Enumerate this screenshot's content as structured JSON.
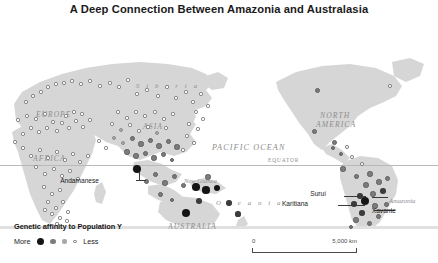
{
  "title": "A Deep Connection Between Amazonia and Australasia",
  "map": {
    "equator_label": "EQUATOR",
    "geo_labels": [
      {
        "text": "EUROPE",
        "x": 36,
        "y": 86,
        "size": 7.4,
        "style": "caps"
      },
      {
        "text": "AFRICA",
        "x": 33,
        "y": 130,
        "size": 7.6,
        "style": "caps"
      },
      {
        "text": "ASIA",
        "x": 143,
        "y": 98,
        "size": 7.6,
        "style": "caps"
      },
      {
        "text": "S i b e r i a",
        "x": 136,
        "y": 58,
        "size": 6.8,
        "style": "spaced"
      },
      {
        "text": "PACIFIC OCEAN",
        "x": 212,
        "y": 119,
        "size": 8.2,
        "style": "caps"
      },
      {
        "text": "NORTH",
        "x": 320,
        "y": 87,
        "size": 7.6,
        "style": "caps"
      },
      {
        "text": "AMERICA",
        "x": 316,
        "y": 96,
        "size": 7.6,
        "style": "caps"
      },
      {
        "text": "SOUTH",
        "x": 352,
        "y": 208,
        "size": 7.6,
        "style": "caps"
      },
      {
        "text": "AMERICA",
        "x": 347,
        "y": 217,
        "size": 7.6,
        "style": "caps"
      },
      {
        "text": "AUSTRALIA",
        "x": 168,
        "y": 198,
        "size": 7.6,
        "style": "caps"
      },
      {
        "text": "New Guinea",
        "x": 184,
        "y": 153,
        "size": 6.6,
        "style": "plain"
      },
      {
        "text": "O c e a n i a",
        "x": 216,
        "y": 175,
        "size": 6.8,
        "style": "spaced"
      },
      {
        "text": "Amazonia",
        "x": 389,
        "y": 173,
        "size": 6.6,
        "style": "plain"
      }
    ],
    "annotations": [
      {
        "text": "Andamanese",
        "x": 99,
        "y": 156
      },
      {
        "text": "Suruí",
        "x": 326,
        "y": 169
      },
      {
        "text": "Karitiana",
        "x": 308,
        "y": 179
      },
      {
        "text": "Xavante",
        "x": 396,
        "y": 186
      }
    ],
    "dots": [
      {
        "x": 26,
        "y": 78,
        "c": "open",
        "s": 3.4
      },
      {
        "x": 33,
        "y": 72,
        "c": "open",
        "s": 3.4
      },
      {
        "x": 41,
        "y": 68,
        "c": "open",
        "s": 3.2
      },
      {
        "x": 48,
        "y": 63,
        "c": "open",
        "s": 3.2
      },
      {
        "x": 56,
        "y": 60,
        "c": "open",
        "s": 3.2
      },
      {
        "x": 64,
        "y": 59,
        "c": "open",
        "s": 3.4
      },
      {
        "x": 72,
        "y": 57,
        "c": "open",
        "s": 3.2
      },
      {
        "x": 81,
        "y": 60,
        "c": "open",
        "s": 3.2
      },
      {
        "x": 90,
        "y": 57,
        "c": "open",
        "s": 3.2
      },
      {
        "x": 100,
        "y": 62,
        "c": "open",
        "s": 3.2
      },
      {
        "x": 110,
        "y": 59,
        "c": "open",
        "s": 3.2
      },
      {
        "x": 119,
        "y": 63,
        "c": "open",
        "s": 3.2
      },
      {
        "x": 128,
        "y": 56,
        "c": "open",
        "s": 3.2
      },
      {
        "x": 137,
        "y": 70,
        "c": "open",
        "s": 3.2
      },
      {
        "x": 147,
        "y": 66,
        "c": "open",
        "s": 3.2
      },
      {
        "x": 158,
        "y": 72,
        "c": "open",
        "s": 3.2
      },
      {
        "x": 167,
        "y": 63,
        "c": "open",
        "s": 3.2
      },
      {
        "x": 176,
        "y": 74,
        "c": "open",
        "s": 3.2
      },
      {
        "x": 186,
        "y": 68,
        "c": "open",
        "s": 3.2
      },
      {
        "x": 193,
        "y": 78,
        "c": "open",
        "s": 3.2
      },
      {
        "x": 201,
        "y": 70,
        "c": "open",
        "s": 3.2
      },
      {
        "x": 208,
        "y": 82,
        "c": "open",
        "s": 3.2
      },
      {
        "x": 196,
        "y": 88,
        "c": "open",
        "s": 3.4
      },
      {
        "x": 203,
        "y": 95,
        "c": "open",
        "s": 3.2
      },
      {
        "x": 189,
        "y": 100,
        "c": "open",
        "s": 3.2
      },
      {
        "x": 198,
        "y": 105,
        "c": "open",
        "s": 3.2
      },
      {
        "x": 187,
        "y": 112,
        "c": "open",
        "s": 3.2
      },
      {
        "x": 194,
        "y": 119,
        "c": "open",
        "s": 3.2
      },
      {
        "x": 183,
        "y": 126,
        "c": "open",
        "s": 3.2
      },
      {
        "x": 18,
        "y": 96,
        "c": "open",
        "s": 3.2
      },
      {
        "x": 27,
        "y": 92,
        "c": "open",
        "s": 3.4
      },
      {
        "x": 36,
        "y": 95,
        "c": "open",
        "s": 3.2
      },
      {
        "x": 45,
        "y": 90,
        "c": "open",
        "s": 3.2
      },
      {
        "x": 53,
        "y": 98,
        "c": "open",
        "s": 3.4
      },
      {
        "x": 47,
        "y": 104,
        "c": "open",
        "s": 3.2
      },
      {
        "x": 39,
        "y": 108,
        "c": "open",
        "s": 3.2
      },
      {
        "x": 31,
        "y": 104,
        "c": "open",
        "s": 3.2
      },
      {
        "x": 23,
        "y": 110,
        "c": "open",
        "s": 3.2
      },
      {
        "x": 57,
        "y": 107,
        "c": "open",
        "s": 3.2
      },
      {
        "x": 62,
        "y": 99,
        "c": "open",
        "s": 3.2
      },
      {
        "x": 69,
        "y": 104,
        "c": "open",
        "s": 3.2
      },
      {
        "x": 76,
        "y": 97,
        "c": "open",
        "s": 3.2
      },
      {
        "x": 83,
        "y": 103,
        "c": "open",
        "s": 3.2
      },
      {
        "x": 90,
        "y": 96,
        "c": "open",
        "s": 3.2
      },
      {
        "x": 66,
        "y": 92,
        "c": "open",
        "s": 3.2
      },
      {
        "x": 74,
        "y": 88,
        "c": "open",
        "s": 3.2
      },
      {
        "x": 82,
        "y": 90,
        "c": "open",
        "s": 3.2
      },
      {
        "x": 15,
        "y": 118,
        "c": "open",
        "s": 3.2
      },
      {
        "x": 23,
        "y": 124,
        "c": "open",
        "s": 3.2
      },
      {
        "x": 31,
        "y": 132,
        "c": "open",
        "s": 3.2
      },
      {
        "x": 40,
        "y": 126,
        "c": "open",
        "s": 3.2
      },
      {
        "x": 48,
        "y": 134,
        "c": "open",
        "s": 3.2
      },
      {
        "x": 57,
        "y": 128,
        "c": "open",
        "s": 3.2
      },
      {
        "x": 65,
        "y": 136,
        "c": "open",
        "s": 3.2
      },
      {
        "x": 73,
        "y": 130,
        "c": "open",
        "s": 3.2
      },
      {
        "x": 80,
        "y": 138,
        "c": "open",
        "s": 3.2
      },
      {
        "x": 88,
        "y": 132,
        "c": "open",
        "s": 3.2
      },
      {
        "x": 36,
        "y": 143,
        "c": "open",
        "s": 3.2
      },
      {
        "x": 45,
        "y": 150,
        "c": "open",
        "s": 3.2
      },
      {
        "x": 54,
        "y": 145,
        "c": "open",
        "s": 3.2
      },
      {
        "x": 62,
        "y": 152,
        "c": "open",
        "s": 3.2
      },
      {
        "x": 70,
        "y": 147,
        "c": "open",
        "s": 3.2
      },
      {
        "x": 78,
        "y": 155,
        "c": "open",
        "s": 3.2
      },
      {
        "x": 44,
        "y": 163,
        "c": "open",
        "s": 3.2
      },
      {
        "x": 52,
        "y": 170,
        "c": "open",
        "s": 3.2
      },
      {
        "x": 60,
        "y": 166,
        "c": "open",
        "s": 3.2
      },
      {
        "x": 48,
        "y": 178,
        "c": "open",
        "s": 3.2
      },
      {
        "x": 56,
        "y": 184,
        "c": "open",
        "s": 3.4
      },
      {
        "x": 63,
        "y": 178,
        "c": "open",
        "s": 3.2
      },
      {
        "x": 52,
        "y": 190,
        "c": "open",
        "s": 3.2
      },
      {
        "x": 60,
        "y": 194,
        "c": "open",
        "s": 3.2
      },
      {
        "x": 68,
        "y": 188,
        "c": "open",
        "s": 3.2
      },
      {
        "x": 45,
        "y": 186,
        "c": "open",
        "s": 3.2
      },
      {
        "x": 67,
        "y": 197,
        "c": "open",
        "s": 3.2
      },
      {
        "x": 57,
        "y": 200,
        "c": "open",
        "s": 3.2
      },
      {
        "x": 118,
        "y": 88,
        "c": "open",
        "s": 3.2
      },
      {
        "x": 127,
        "y": 94,
        "c": "open",
        "s": 3.2
      },
      {
        "x": 136,
        "y": 88,
        "c": "open",
        "s": 3.2
      },
      {
        "x": 145,
        "y": 92,
        "c": "open",
        "s": 3.2
      },
      {
        "x": 155,
        "y": 88,
        "c": "open",
        "s": 3.2
      },
      {
        "x": 164,
        "y": 95,
        "c": "open",
        "s": 3.2
      },
      {
        "x": 173,
        "y": 90,
        "c": "open",
        "s": 3.2
      },
      {
        "x": 112,
        "y": 100,
        "c": "open",
        "s": 3.2
      },
      {
        "x": 121,
        "y": 106,
        "c": "light",
        "s": 4.2
      },
      {
        "x": 130,
        "y": 101,
        "c": "open",
        "s": 3.2
      },
      {
        "x": 139,
        "y": 107,
        "c": "open",
        "s": 3.2
      },
      {
        "x": 148,
        "y": 103,
        "c": "open",
        "s": 3.2
      },
      {
        "x": 157,
        "y": 109,
        "c": "light",
        "s": 4.2
      },
      {
        "x": 166,
        "y": 104,
        "c": "open",
        "s": 3.2
      },
      {
        "x": 114,
        "y": 114,
        "c": "light",
        "s": 4.4
      },
      {
        "x": 123,
        "y": 119,
        "c": "light",
        "s": 4.2
      },
      {
        "x": 132,
        "y": 114,
        "c": "mid",
        "s": 5.0
      },
      {
        "x": 141,
        "y": 120,
        "c": "mid",
        "s": 5.2
      },
      {
        "x": 150,
        "y": 116,
        "c": "mid",
        "s": 5.0
      },
      {
        "x": 159,
        "y": 122,
        "c": "mid",
        "s": 5.4
      },
      {
        "x": 168,
        "y": 117,
        "c": "mid",
        "s": 5.0
      },
      {
        "x": 177,
        "y": 123,
        "c": "mid",
        "s": 5.2
      },
      {
        "x": 127,
        "y": 128,
        "c": "mid",
        "s": 5.2
      },
      {
        "x": 136,
        "y": 132,
        "c": "mid",
        "s": 5.4
      },
      {
        "x": 145,
        "y": 129,
        "c": "mid",
        "s": 5.0
      },
      {
        "x": 154,
        "y": 134,
        "c": "mid",
        "s": 5.2
      },
      {
        "x": 163,
        "y": 130,
        "c": "mid",
        "s": 5.0
      },
      {
        "x": 172,
        "y": 136,
        "c": "mid",
        "s": 4.8
      },
      {
        "x": 106,
        "y": 124,
        "c": "open",
        "s": 3.2
      },
      {
        "x": 99,
        "y": 117,
        "c": "open",
        "s": 3.2
      },
      {
        "x": 137,
        "y": 145,
        "c": "black",
        "s": 8.4
      },
      {
        "x": 146,
        "y": 157,
        "c": "mid",
        "s": 5.0
      },
      {
        "x": 155,
        "y": 150,
        "c": "mid",
        "s": 5.0
      },
      {
        "x": 165,
        "y": 159,
        "c": "mid",
        "s": 5.2
      },
      {
        "x": 174,
        "y": 152,
        "c": "mid",
        "s": 5.0
      },
      {
        "x": 183,
        "y": 161,
        "c": "mid",
        "s": 5.0
      },
      {
        "x": 160,
        "y": 170,
        "c": "mid",
        "s": 5.0
      },
      {
        "x": 172,
        "y": 176,
        "c": "mid",
        "s": 4.8
      },
      {
        "x": 208,
        "y": 153,
        "c": "mid",
        "s": 5.2
      },
      {
        "x": 196,
        "y": 163,
        "c": "black",
        "s": 7.6
      },
      {
        "x": 206,
        "y": 166,
        "c": "black",
        "s": 7.2
      },
      {
        "x": 217,
        "y": 164,
        "c": "black",
        "s": 6.2
      },
      {
        "x": 199,
        "y": 177,
        "c": "dark",
        "s": 5.6
      },
      {
        "x": 229,
        "y": 179,
        "c": "dark",
        "s": 5.4
      },
      {
        "x": 238,
        "y": 190,
        "c": "dark",
        "s": 5.2
      },
      {
        "x": 186,
        "y": 189,
        "c": "black",
        "s": 8.2
      },
      {
        "x": 317,
        "y": 66,
        "c": "mid",
        "s": 5.0
      },
      {
        "x": 390,
        "y": 62,
        "c": "open",
        "s": 3.6
      },
      {
        "x": 314,
        "y": 107,
        "c": "mid",
        "s": 5.0
      },
      {
        "x": 334,
        "y": 118,
        "c": "mid",
        "s": 5.0
      },
      {
        "x": 333,
        "y": 124,
        "c": "mid",
        "s": 4.8
      },
      {
        "x": 341,
        "y": 130,
        "c": "mid",
        "s": 4.8
      },
      {
        "x": 352,
        "y": 133,
        "c": "open",
        "s": 3.6
      },
      {
        "x": 347,
        "y": 123,
        "c": "open",
        "s": 3.6
      },
      {
        "x": 343,
        "y": 145,
        "c": "mid",
        "s": 5.2
      },
      {
        "x": 362,
        "y": 140,
        "c": "open",
        "s": 3.6
      },
      {
        "x": 356,
        "y": 152,
        "c": "mid",
        "s": 5.0
      },
      {
        "x": 370,
        "y": 150,
        "c": "mid",
        "s": 5.2
      },
      {
        "x": 366,
        "y": 161,
        "c": "mid",
        "s": 5.4
      },
      {
        "x": 379,
        "y": 158,
        "c": "mid",
        "s": 5.2
      },
      {
        "x": 387,
        "y": 154,
        "c": "mid",
        "s": 5.0
      },
      {
        "x": 373,
        "y": 170,
        "c": "mid",
        "s": 5.4
      },
      {
        "x": 383,
        "y": 167,
        "c": "dark",
        "s": 5.6
      },
      {
        "x": 360,
        "y": 172,
        "c": "dark",
        "s": 5.6
      },
      {
        "x": 365,
        "y": 177,
        "c": "black",
        "s": 8.6
      },
      {
        "x": 354,
        "y": 180,
        "c": "dark",
        "s": 5.4
      },
      {
        "x": 375,
        "y": 182,
        "c": "mid",
        "s": 5.2
      },
      {
        "x": 386,
        "y": 180,
        "c": "mid",
        "s": 5.0
      },
      {
        "x": 362,
        "y": 189,
        "c": "dark",
        "s": 5.4
      },
      {
        "x": 378,
        "y": 192,
        "c": "mid",
        "s": 5.0
      },
      {
        "x": 356,
        "y": 196,
        "c": "mid",
        "s": 5.2
      },
      {
        "x": 369,
        "y": 199,
        "c": "mid",
        "s": 5.0
      },
      {
        "x": 351,
        "y": 203,
        "c": "mid",
        "s": 4.8
      }
    ]
  },
  "legend": {
    "title": "Genetic affinity to Population Y",
    "more_label": "More",
    "less_label": "Less"
  },
  "scale": {
    "min": "0",
    "max": "5,000 km"
  }
}
